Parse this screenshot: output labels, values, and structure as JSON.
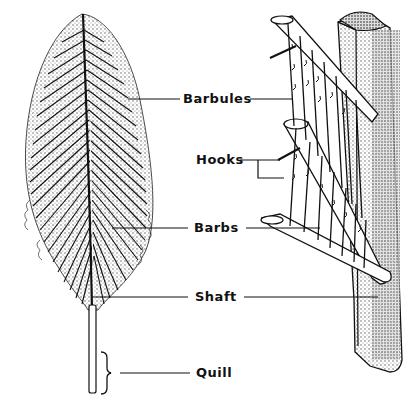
{
  "diagram": {
    "colors": {
      "ink": "#111111",
      "background": "#ffffff",
      "stipple": "#9a9a9a"
    },
    "labels": [
      {
        "id": "barbules",
        "text": "Barbules"
      },
      {
        "id": "hooks",
        "text": "Hooks"
      },
      {
        "id": "barbs",
        "text": "Barbs"
      },
      {
        "id": "shaft",
        "text": "Shaft"
      },
      {
        "id": "quill",
        "text": "Quill"
      }
    ],
    "parts": {
      "feather": "whole feather illustration",
      "detail": "magnified barb / barbule / hook structure attached to shaft"
    }
  }
}
